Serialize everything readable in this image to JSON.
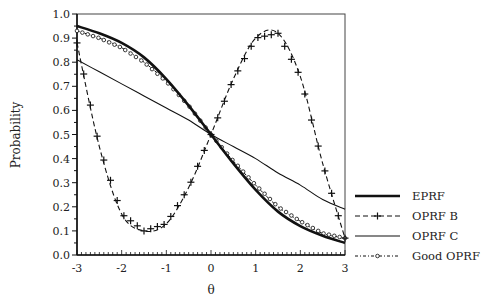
{
  "chart_data": {
    "type": "line",
    "title": "",
    "xlabel": "θ",
    "ylabel": "Probability",
    "xlim": [
      -3,
      3
    ],
    "ylim": [
      0,
      1
    ],
    "xticks": [
      -3,
      -2,
      -1,
      0,
      1,
      2,
      3
    ],
    "xtick_labels": [
      "-3",
      "-2",
      "-1",
      "0",
      "1",
      "2",
      "3"
    ],
    "yticks": [
      0,
      0.1,
      0.2,
      0.3,
      0.4,
      0.5,
      0.6,
      0.7,
      0.8,
      0.9,
      1.0
    ],
    "ytick_labels": [
      "0.0",
      "0.1",
      "0.2",
      "0.3",
      "0.4",
      "0.5",
      "0.6",
      "0.7",
      "0.8",
      "0.9",
      "1.0"
    ],
    "grid": false,
    "legend_position": "right",
    "x": [
      -3.0,
      -2.5,
      -2.0,
      -1.5,
      -1.0,
      -0.5,
      0.0,
      0.5,
      1.0,
      1.5,
      2.0,
      2.5,
      3.0
    ],
    "series": [
      {
        "name": "EPRF",
        "style": "solid-thick",
        "values": [
          0.95,
          0.92,
          0.88,
          0.82,
          0.73,
          0.62,
          0.5,
          0.38,
          0.27,
          0.18,
          0.12,
          0.08,
          0.05
        ]
      },
      {
        "name": "OPRF B",
        "style": "dashed-plus",
        "values": [
          0.88,
          0.45,
          0.17,
          0.1,
          0.13,
          0.28,
          0.5,
          0.73,
          0.9,
          0.92,
          0.74,
          0.38,
          0.07
        ]
      },
      {
        "name": "OPRF C",
        "style": "solid-thin",
        "values": [
          0.81,
          0.76,
          0.71,
          0.66,
          0.61,
          0.56,
          0.5,
          0.45,
          0.4,
          0.34,
          0.29,
          0.23,
          0.19
        ]
      },
      {
        "name": "Good OPRF",
        "style": "dashdot-circle",
        "values": [
          0.93,
          0.9,
          0.86,
          0.8,
          0.72,
          0.62,
          0.5,
          0.39,
          0.29,
          0.2,
          0.14,
          0.09,
          0.07
        ]
      }
    ]
  },
  "legend": {
    "items": [
      "EPRF",
      "OPRF B",
      "OPRF C",
      "Good OPRF"
    ]
  }
}
